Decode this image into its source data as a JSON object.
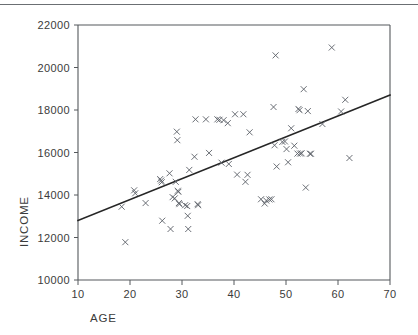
{
  "figure": {
    "separator_color": "#6b6f73",
    "frame_color": "#55585c",
    "marker_color": "#5a5f66",
    "line_color": "#262626",
    "marker_symbol": "x"
  },
  "labels": {
    "x_axis_title": "AGE",
    "y_axis_title": "INCOME",
    "x_ticks": [
      "10",
      "20",
      "30",
      "40",
      "50",
      "60",
      "70"
    ],
    "y_ticks": [
      "10000",
      "12000",
      "14000",
      "16000",
      "18000",
      "20000",
      "22000"
    ]
  },
  "chart_data": {
    "type": "scatter",
    "title": "",
    "xlabel": "AGE",
    "ylabel": "INCOME",
    "xlim": [
      10,
      70
    ],
    "ylim": [
      10000,
      22000
    ],
    "xticks": [
      10,
      20,
      30,
      40,
      50,
      60,
      70
    ],
    "yticks": [
      10000,
      12000,
      14000,
      16000,
      18000,
      20000,
      22000
    ],
    "grid": false,
    "legend": false,
    "marker": "x",
    "series": [
      {
        "name": "observations",
        "x": [
          18.4,
          19.1,
          20.8,
          21.0,
          23.0,
          25.8,
          26.0,
          26.1,
          26.2,
          27.6,
          27.8,
          28.2,
          28.6,
          28.8,
          29.0,
          29.1,
          29.2,
          29.3,
          29.4,
          29.5,
          30.6,
          31.0,
          31.1,
          31.2,
          31.4,
          32.4,
          32.6,
          33.0,
          33.1,
          34.6,
          35.2,
          36.8,
          37.2,
          37.6,
          38.0,
          38.8,
          39.0,
          40.2,
          40.6,
          41.8,
          42.2,
          42.6,
          43.0,
          45.2,
          45.9,
          46.2,
          46.8,
          47.2,
          47.6,
          47.8,
          48.0,
          48.2,
          49.3,
          49.8,
          50.1,
          50.4,
          51.0,
          51.6,
          52.2,
          52.4,
          52.6,
          52.7,
          53.0,
          53.4,
          53.8,
          54.2,
          54.6,
          54.8,
          57.0,
          58.8,
          60.6,
          61.4,
          62.2
        ],
        "y": [
          13450,
          11780,
          14220,
          14080,
          13620,
          14750,
          14680,
          14600,
          12790,
          15020,
          12400,
          13900,
          13840,
          14620,
          16980,
          16580,
          14200,
          14150,
          13620,
          13570,
          13520,
          13480,
          13020,
          12400,
          15180,
          15800,
          17560,
          13570,
          13520,
          17560,
          15980,
          17560,
          17540,
          15520,
          17520,
          17380,
          15460,
          17800,
          14960,
          17800,
          14620,
          14950,
          16950,
          13800,
          13600,
          13740,
          13790,
          13800,
          18140,
          16340,
          20570,
          15340,
          16500,
          16520,
          16160,
          15540,
          17140,
          16320,
          15950,
          18050,
          17990,
          15950,
          15960,
          18980,
          14350,
          17950,
          15940,
          15940,
          17340,
          20940,
          17930,
          18480,
          15740
        ]
      }
    ],
    "fit_line": {
      "name": "regression-line",
      "x": [
        10,
        70
      ],
      "y": [
        12800,
        18700
      ]
    }
  }
}
